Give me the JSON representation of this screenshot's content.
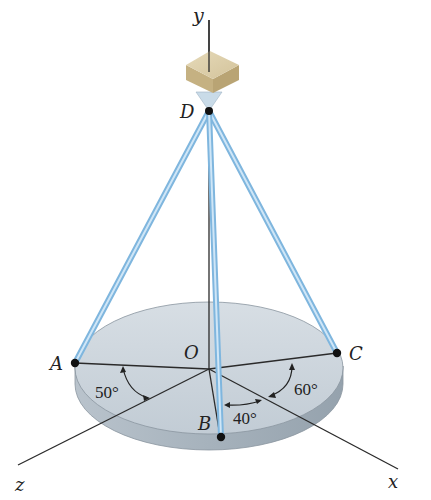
{
  "figure": {
    "axes": {
      "x_label": "x",
      "y_label": "y",
      "z_label": "z"
    },
    "points": {
      "A": "A",
      "B": "B",
      "C": "C",
      "D": "D",
      "O": "O"
    },
    "angles": {
      "angle_A_z": "50°",
      "angle_B_x": "40°",
      "angle_C_x": "60°"
    },
    "colors": {
      "rod": "#8fc3e8",
      "rod_highlight": "#d3e9f8",
      "disk_top": "#c9d3db",
      "disk_side": "#a9b5bf",
      "box_top": "#ddd0ad",
      "box_side": "#c6b283",
      "axis": "#2a2a2a"
    }
  }
}
